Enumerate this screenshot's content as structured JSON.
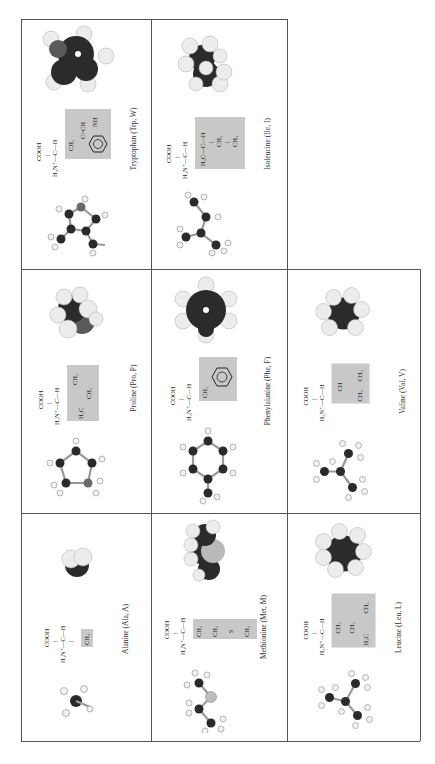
{
  "figure": {
    "orientation": "rotated-90-ccw",
    "layout": "3x3 grid, one empty cell",
    "side_chain_highlight_color": "#c8c8c8",
    "cells": [
      {
        "id": "tryptophan",
        "caption": "Tryptophan (Trp, W)",
        "formula": {
          "top": "COOH",
          "main": "H3N+—C—H",
          "side": [
            "CH2",
            "C=CH",
            "NH"
          ]
        }
      },
      {
        "id": "isoleucine",
        "caption": "Isoleucine (Ile, I)",
        "formula": {
          "top": "COOH",
          "main": "H3N+—C—H",
          "side": [
            "H3C—C—H",
            "CH2",
            "CH3"
          ]
        }
      },
      {
        "id": "proline",
        "caption": "Proline (Pro, P)",
        "formula": {
          "top": "COOH",
          "main": "H2N+—C—H",
          "side": [
            "H2C",
            "CH2",
            "CH2"
          ]
        }
      },
      {
        "id": "phenylalanine",
        "caption": "Phenylalanine (Phe, F)",
        "formula": {
          "top": "COOH",
          "main": "H3N+—C—H",
          "side": [
            "CH2",
            "benzene"
          ]
        }
      },
      {
        "id": "valine",
        "caption": "Valine (Val, V)",
        "formula": {
          "top": "COOH",
          "main": "H3N+—C—H",
          "side": [
            "CH",
            "CH3",
            "CH3"
          ]
        }
      },
      {
        "id": "alanine",
        "caption": "Alanine (Ala, A)",
        "formula": {
          "top": "COOH",
          "main": "H3N+—C—H",
          "side": [
            "CH3"
          ]
        }
      },
      {
        "id": "methionine",
        "caption": "Methionine (Met, M)",
        "formula": {
          "top": "COOH",
          "main": "H3N+—C—H",
          "side": [
            "CH2",
            "CH2",
            "S",
            "CH3"
          ]
        }
      },
      {
        "id": "leucine",
        "caption": "Leucine (Leu, L)",
        "formula": {
          "top": "COOH",
          "main": "H3N+—C—H",
          "side": [
            "CH2",
            "CH",
            "H3C",
            "CH3"
          ]
        }
      }
    ]
  },
  "labels": {
    "cooh": "COOH",
    "h3n": "H₃N⁺—C—H",
    "h2n": "H₂N⁺—C—H",
    "ch2": "CH₂",
    "ch3": "CH₃",
    "ch": "CH",
    "s": "S",
    "h3c": "H₃C",
    "h2c": "H₂C",
    "ile_branch": "H₃C—C—H",
    "trp_ring": "C=CH",
    "nh": "NH"
  }
}
